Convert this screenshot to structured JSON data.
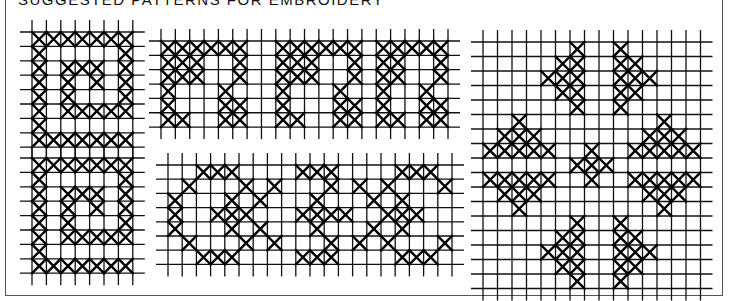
{
  "title": "SUGGESTED PATTERNS FOR EMBROIDERY",
  "colors": {
    "ink": "#000000",
    "grid": "#111111",
    "background": "#ffffff"
  },
  "patterns": [
    {
      "name": "spiral-top",
      "x": 32,
      "y": 32,
      "cell": 14.4,
      "rows": [
        "1111111",
        "1000001",
        "1011101",
        "1010101",
        "1010001",
        "1011111",
        "1000000",
        "1111111"
      ]
    },
    {
      "name": "spiral-bottom",
      "x": 32,
      "y": 158,
      "cell": 14.4,
      "rows": [
        "1111111",
        "1000001",
        "1011101",
        "1010101",
        "1010001",
        "1011111",
        "1000000",
        "1111111"
      ]
    },
    {
      "name": "key-border",
      "x": 161,
      "y": 41,
      "cell": 14.35,
      "rows": [
        "11111100111111011111",
        "11100100111001011001",
        "11100100111001011001",
        "10001000100010010010",
        "10001100100011010011",
        "11001100110011011011"
      ]
    },
    {
      "name": "octagon-border",
      "x": 168,
      "y": 165,
      "cell": 14.2,
      "rows": [
        "00111000011100001110",
        "01000101000101010001",
        "10001010001000101000",
        "10011100011110011100",
        "10001010001000101000",
        "01000101000101010001",
        "00111000011100001110"
      ]
    },
    {
      "name": "floral-motif",
      "x": 483,
      "y": 42,
      "cell": 14.5,
      "rows": [
        "000000100100000",
        "000001100110000",
        "000011100111000",
        "000001100110000",
        "000000100100000",
        "002000000000200",
        "011100000001110",
        "111110010011111",
        "000000111000000",
        "111110010011111",
        "011100000001110",
        "001000000000100",
        "000000100100000",
        "000001100110000",
        "000011100111000",
        "000001100110000",
        "000000100100000"
      ]
    }
  ]
}
